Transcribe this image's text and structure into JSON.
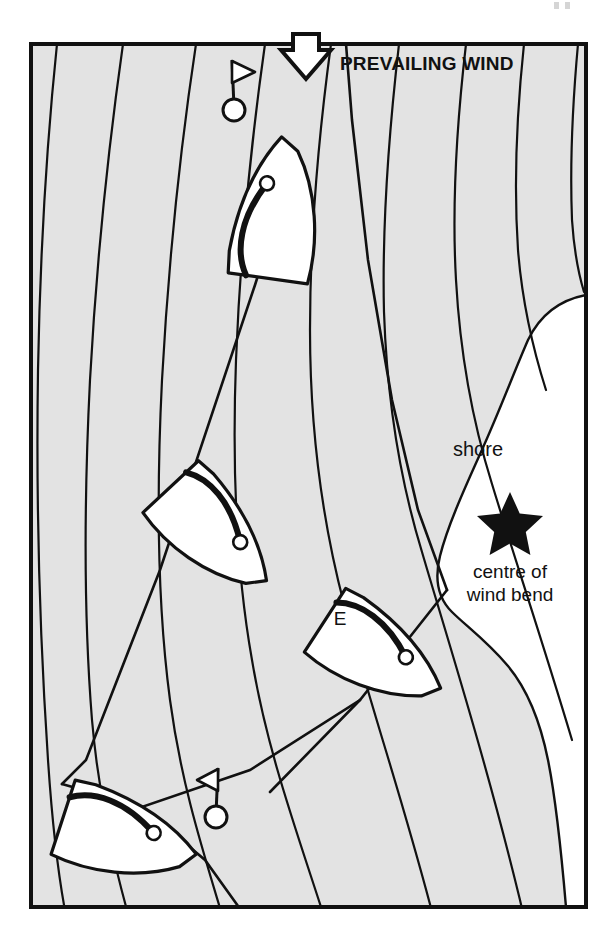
{
  "figure": {
    "kind": "sailing-tactics-diagram",
    "background_color": "#ffffff",
    "water_fill": "#e3e3e3",
    "shore_fill": "#ffffff",
    "ink_color": "#111111",
    "frame": {
      "x": 29,
      "y": 42,
      "width": 559,
      "height": 867,
      "stroke_width": 4
    }
  },
  "annotations": {
    "prevailing_wind": {
      "label": "PREVAILING WIND",
      "icon": "down-arrow-outline",
      "x": 332,
      "y": 66
    },
    "shore": {
      "label": "shore",
      "x": 478,
      "y": 449
    },
    "centre_of_wind_bend": {
      "line1": "centre of",
      "line2": "wind bend",
      "icon": "star",
      "star_x": 510,
      "star_y": 519,
      "x": 510,
      "y": 551
    },
    "boat_letter": {
      "label": "E",
      "x": 340,
      "y": 625
    }
  },
  "marks": [
    {
      "name": "committee-flag-top",
      "type": "buoy-with-flag",
      "flag_side": "right",
      "buoy_x": 234,
      "buoy_y": 110,
      "mast_top_y": 60
    },
    {
      "name": "committee-flag-bottom",
      "type": "buoy-with-flag",
      "flag_side": "left",
      "buoy_x": 216,
      "buoy_y": 817,
      "mast_top_y": 768
    }
  ],
  "boats": [
    {
      "name": "boat-north",
      "x": 277,
      "y": 213,
      "rotation_deg": 8,
      "letter": ""
    },
    {
      "name": "boat-west",
      "x": 213,
      "y": 532,
      "rotation_deg": 137,
      "letter": ""
    },
    {
      "name": "boat-east",
      "x": 377,
      "y": 654,
      "rotation_deg": 123,
      "letter": "E"
    },
    {
      "name": "boat-south",
      "x": 124,
      "y": 837,
      "rotation_deg": 108,
      "letter": ""
    }
  ],
  "wind_lines": {
    "count": 9,
    "description": "curved streamlines bending around the shore",
    "stroke_width": 2.2
  },
  "track": {
    "description": "beat to windward with two tacks",
    "stroke_width": 2.6,
    "tack_vertices": [
      {
        "name": "tack-left",
        "x": 62,
        "y": 784
      },
      {
        "name": "tack-right",
        "x": 447,
        "y": 590
      }
    ]
  }
}
